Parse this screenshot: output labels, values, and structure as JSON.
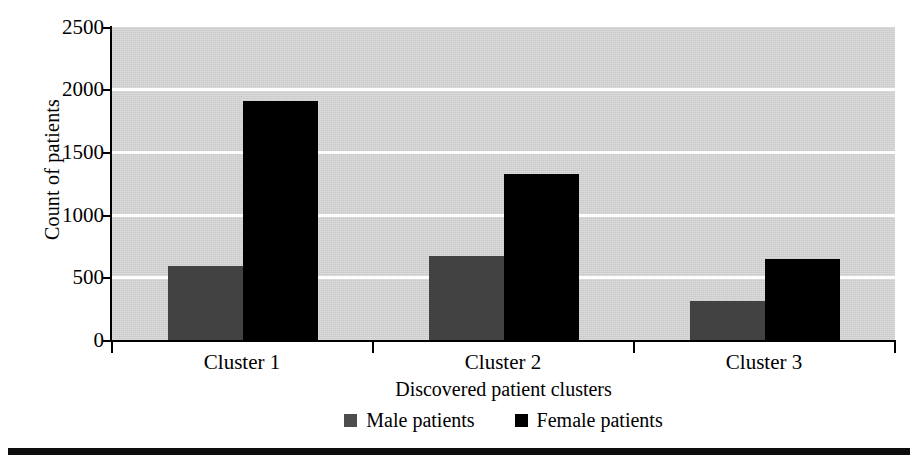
{
  "chart_data": {
    "type": "bar",
    "title": "",
    "categories": [
      "Cluster 1",
      "Cluster 2",
      "Cluster 3"
    ],
    "series": [
      {
        "name": "Male patients",
        "color": "#424242",
        "values": [
          588,
          668,
          310
        ]
      },
      {
        "name": "Female patients",
        "color": "#000000",
        "values": [
          1910,
          1325,
          645
        ]
      }
    ],
    "xlabel": "Discovered patient clusters",
    "ylabel": "Count of patients",
    "ylim": [
      0,
      2500
    ],
    "yticks": [
      0,
      500,
      1000,
      1500,
      2000,
      2500
    ],
    "ytick_labels": [
      "0",
      "500",
      "1000",
      "1500",
      "2000",
      "2500"
    ],
    "grid": "horizontal",
    "gridline_color": "#fdfdfd",
    "plot_background": "#d3d3d3",
    "legend_position": "bottom-center",
    "legend_entries": [
      "Male patients",
      "Female patients"
    ]
  },
  "axes": {
    "y_title": "Count of patients",
    "x_title": "Discovered patient clusters",
    "y_tick_labels": [
      "2500",
      "2000",
      "1500",
      "1000",
      "500",
      "0"
    ],
    "x_tick_labels": [
      "Cluster 1",
      "Cluster 2",
      "Cluster 3"
    ]
  },
  "legend": {
    "items": [
      {
        "label": "Male patients",
        "swatch": "square-gray-icon"
      },
      {
        "label": "Female patients",
        "swatch": "square-black-icon"
      }
    ]
  }
}
